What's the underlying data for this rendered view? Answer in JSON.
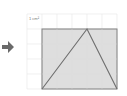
{
  "diagram": {
    "unit_label": "1 cm²",
    "grid": {
      "cols": 6,
      "rows": 5,
      "color": "#e6e6e6"
    },
    "rectangle": {
      "fill": "#d8d8d8",
      "stroke": "#808080"
    },
    "triangle": {
      "stroke": "#6e6e6e"
    },
    "arrow_color": "#6a6a6a"
  }
}
